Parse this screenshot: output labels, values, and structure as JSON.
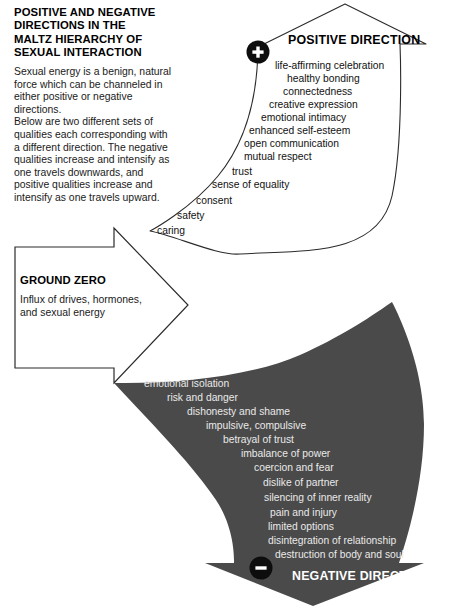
{
  "title": {
    "lines": [
      "POSITIVE AND NEGATIVE",
      "DIRECTIONS IN THE",
      "MALTZ HIERARCHY OF",
      "SEXUAL INTERACTION"
    ]
  },
  "intro": {
    "lines": [
      "Sexual energy is a benign, natural",
      "force which can be channeled in",
      "either positive or negative",
      "directions.",
      "Below are two different sets of",
      "qualities each corresponding with",
      "a different direction. The negative",
      "qualities increase and intensify as",
      "one travels downwards, and",
      "positive qualities increase and",
      "intensify as one travels upward."
    ]
  },
  "ground_zero": {
    "heading": "GROUND ZERO",
    "lines": [
      "Influx of drives, hormones,",
      "and sexual energy"
    ]
  },
  "positive": {
    "heading": "POSITIVE DIRECTION",
    "badge": "plus-badge",
    "badge_symbol": "+",
    "items": [
      {
        "label": "life-affirming celebration",
        "x": 275,
        "y": 60
      },
      {
        "label": "healthy bonding",
        "x": 287,
        "y": 73
      },
      {
        "label": "connectedness",
        "x": 283,
        "y": 86
      },
      {
        "label": "creative expression",
        "x": 269,
        "y": 99
      },
      {
        "label": "emotional intimacy",
        "x": 261,
        "y": 112
      },
      {
        "label": "enhanced self-esteem",
        "x": 249,
        "y": 125
      },
      {
        "label": "open communication",
        "x": 244,
        "y": 138
      },
      {
        "label": "mutual respect",
        "x": 244,
        "y": 151
      },
      {
        "label": "trust",
        "x": 232,
        "y": 166
      },
      {
        "label": "sense of equality",
        "x": 212,
        "y": 179
      },
      {
        "label": "consent",
        "x": 196,
        "y": 195
      },
      {
        "label": "safety",
        "x": 177,
        "y": 210
      },
      {
        "label": "caring",
        "x": 157,
        "y": 225
      }
    ]
  },
  "negative": {
    "heading": "NEGATIVE DIRECTION",
    "badge": "minus-badge",
    "badge_symbol": "−",
    "items": [
      {
        "label": "emotional isolation",
        "x": 144,
        "y": 378
      },
      {
        "label": "risk and danger",
        "x": 167,
        "y": 392
      },
      {
        "label": "dishonesty and shame",
        "x": 187,
        "y": 406
      },
      {
        "label": "impulsive, compulsive",
        "x": 206,
        "y": 420
      },
      {
        "label": "betrayal of trust",
        "x": 223,
        "y": 434
      },
      {
        "label": "imbalance of power",
        "x": 241,
        "y": 448
      },
      {
        "label": "coercion and fear",
        "x": 254,
        "y": 462
      },
      {
        "label": "dislike of partner",
        "x": 263,
        "y": 477
      },
      {
        "label": "silencing of inner reality",
        "x": 264,
        "y": 492
      },
      {
        "label": "pain and injury",
        "x": 270,
        "y": 507
      },
      {
        "label": "limited options",
        "x": 268,
        "y": 521
      },
      {
        "label": "disintegration of relationship",
        "x": 268,
        "y": 535
      },
      {
        "label": "destruction of body and soul",
        "x": 275,
        "y": 549
      }
    ]
  },
  "colors": {
    "negative_fill": "#4a4a4a",
    "outline": "#2b2b2b",
    "positive_text": "#111111",
    "negative_text": "#e9e9e9",
    "page_background": "#ffffff"
  }
}
